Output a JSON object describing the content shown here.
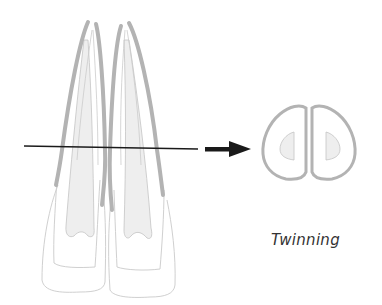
{
  "figure": {
    "caption": "Twinning",
    "colors": {
      "enamel_band": "#b3b3b3",
      "outline": "#cccccc",
      "pulp_fill": "#ededed",
      "pulp_stroke": "#c4c4c4",
      "section_line": "#1a1a1a",
      "arrow": "#1a1a1a",
      "caption_text": "#333333"
    },
    "elements": {
      "left_tooth": "incisor, longitudinal view",
      "right_tooth": "incisor, longitudinal view",
      "section_line": "horizontal cut line",
      "arrow": "right-pointing arrow",
      "cross_section": "twinned cross-section with two pulp chambers"
    }
  }
}
